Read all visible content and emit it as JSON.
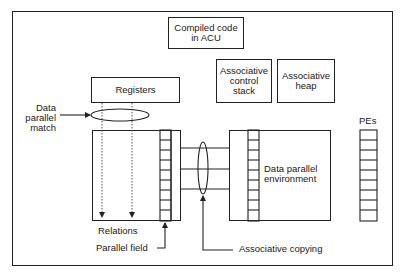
{
  "diagram": {
    "boxes": {
      "compiled_code": "Compiled code in ACU",
      "compiled_code_lines": [
        "Compiled code",
        "in ACU"
      ],
      "registers": "Registers",
      "assoc_control_stack_lines": [
        "Associative",
        "control",
        "stack"
      ],
      "assoc_heap_lines": [
        "Associative",
        "heap"
      ],
      "data_parallel_env_lines": [
        "Data parallel",
        "environment"
      ]
    },
    "labels": {
      "data_parallel_match_lines": [
        "Data",
        "parallel",
        "match"
      ],
      "pes": "PEs",
      "relations": "Relations",
      "parallel_field": "Parallel field",
      "associative_copying": "Associative copying"
    },
    "structure": {
      "parallel_field_cells": 9,
      "pe_cells": 9,
      "environment_cells": 9
    }
  }
}
